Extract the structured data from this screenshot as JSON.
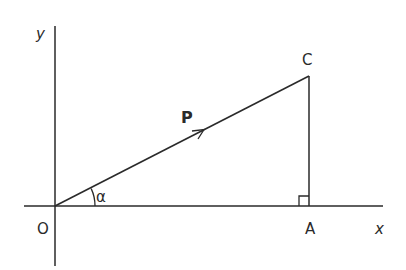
{
  "diagram": {
    "type": "vector-resolution",
    "colors": {
      "line": "#2a2a2a",
      "background": "#ffffff"
    },
    "labels": {
      "origin": "O",
      "point_c": "C",
      "point_a": "A",
      "x_axis": "x",
      "y_axis": "y",
      "vector": "P",
      "angle": "α"
    },
    "elements": [
      {
        "id": "x-axis",
        "kind": "axis",
        "label": "x"
      },
      {
        "id": "y-axis",
        "kind": "axis",
        "label": "y"
      },
      {
        "id": "vector-P",
        "kind": "arrow",
        "from": "O",
        "to": "C",
        "label": "P"
      },
      {
        "id": "segment-CA",
        "kind": "line",
        "from": "C",
        "to": "A"
      },
      {
        "id": "right-angle",
        "kind": "marker",
        "at": "A"
      },
      {
        "id": "angle-alpha",
        "kind": "arc",
        "at": "O",
        "label": "α"
      }
    ]
  }
}
